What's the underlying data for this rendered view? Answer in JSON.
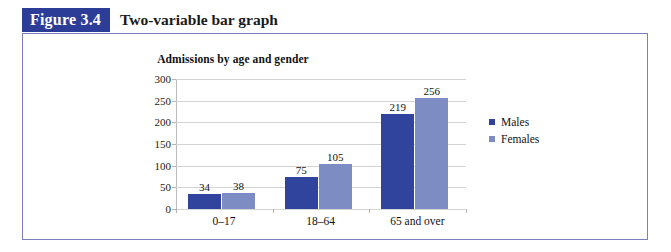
{
  "figure": {
    "number_label": "Figure 3.4",
    "caption": "Two-variable bar graph"
  },
  "colors": {
    "figure_number_bg": "#2b3d96",
    "frame_border": "#7b7fc0",
    "males_bar": "#30449e",
    "females_bar": "#7e8cc4",
    "gridline": "#d4d4d4",
    "text": "#111111"
  },
  "legend": {
    "position": "right",
    "entries": [
      {
        "label": "Males",
        "color": "#30449e",
        "swatch_icon": "square-marker"
      },
      {
        "label": "Females",
        "color": "#7e8cc4",
        "swatch_icon": "square-marker"
      }
    ]
  },
  "chart_data": {
    "type": "bar",
    "title": "Admissions by age and gender",
    "xlabel": "",
    "ylabel": "",
    "categories": [
      "0–17",
      "18–64",
      "65 and over"
    ],
    "series": [
      {
        "name": "Males",
        "values": [
          34,
          75,
          219
        ],
        "color": "#30449e"
      },
      {
        "name": "Females",
        "values": [
          38,
          105,
          256
        ],
        "color": "#7e8cc4"
      }
    ],
    "data_labels": [
      [
        "34",
        "38"
      ],
      [
        "75",
        "105"
      ],
      [
        "219",
        "256"
      ]
    ],
    "ylim": [
      0,
      300
    ],
    "ytick_values": [
      0,
      50,
      100,
      150,
      200,
      250,
      300
    ],
    "ytick_labels": [
      "0",
      "50",
      "100",
      "150",
      "200",
      "250",
      "300"
    ],
    "grid": "horizontal",
    "legend_position": "right"
  }
}
